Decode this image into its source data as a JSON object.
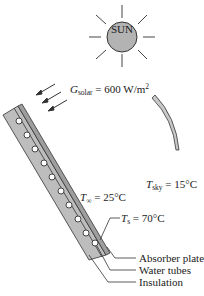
{
  "sun": {
    "label": "SUN",
    "color": "#b3b3b3"
  },
  "solar": {
    "symbol": "G",
    "subscript": "solar",
    "value": "= 600 W/m",
    "exp": "2"
  },
  "ambient": {
    "symbol": "T",
    "subscript": "∞",
    "value": "= 25°C"
  },
  "sky": {
    "symbol": "T",
    "subscript": "sky",
    "value": "= 15°C"
  },
  "surface": {
    "symbol": "T",
    "subscript": "s",
    "value": "= 70°C"
  },
  "callouts": {
    "absorber": "Absorber plate",
    "tubes": "Water tubes",
    "insulation": "Insulation"
  },
  "colors": {
    "panel": "#bdbdbd",
    "stroke": "#333333",
    "sky_arc": "#c8c8c8"
  }
}
